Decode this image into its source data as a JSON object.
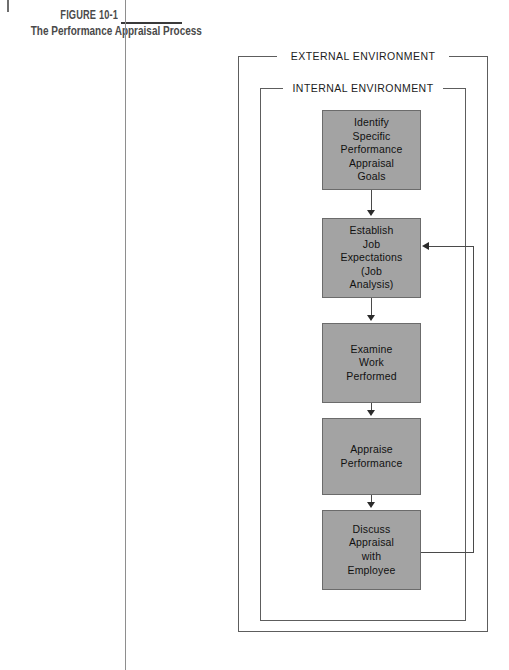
{
  "figure": {
    "number": "FIGURE 10-1",
    "title": "The Performance Appraisal Process"
  },
  "diagram": {
    "outer_frame_label": "EXTERNAL ENVIRONMENT",
    "inner_frame_label": "INTERNAL ENVIRONMENT",
    "box_fill_color": "#a3a3a3",
    "box_border_color": "#6b6b6b",
    "connector_color": "#4a4a4a",
    "steps": [
      {
        "id": "identify-goals",
        "text": "Identify\nSpecific\nPerformance\nAppraisal\nGoals"
      },
      {
        "id": "establish-job",
        "text": "Establish\nJob\nExpectations\n(Job\nAnalysis)"
      },
      {
        "id": "examine-work",
        "text": "Examine\nWork\nPerformed"
      },
      {
        "id": "appraise-performance",
        "text": "Appraise\nPerformance"
      },
      {
        "id": "discuss-appraisal",
        "text": "Discuss\nAppraisal\nwith\nEmployee"
      }
    ],
    "feedback_loop": {
      "from": "discuss-appraisal",
      "to": "establish-job"
    }
  }
}
